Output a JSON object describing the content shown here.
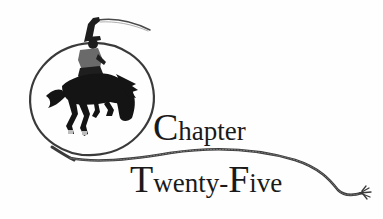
{
  "heading": {
    "line1": {
      "cap": "C",
      "rest": "hapter"
    },
    "line2": {
      "cap1": "T",
      "mid": "wenty-",
      "cap2": "F",
      "rest": "ive"
    }
  },
  "illustration": {
    "subject": "cowboy-on-bucking-horse-with-lasso",
    "colors": {
      "ink": "#1a1a1a",
      "rope": "#3a3a3a",
      "background": "#fefefe"
    }
  }
}
